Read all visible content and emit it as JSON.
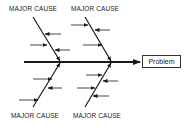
{
  "diagram": {
    "type": "fishbone",
    "problem_label": "Problem",
    "causes": [
      {
        "position": "top-left",
        "label": "MAJOR CAUSE",
        "minor_arrows": 3
      },
      {
        "position": "top-right",
        "label": "MAJOR CAUSE",
        "minor_arrows": 3
      },
      {
        "position": "bottom-left",
        "label": "MAJOR CAUSE",
        "minor_arrows": 3
      },
      {
        "position": "bottom-right",
        "label": "MAJOR CAUSE",
        "minor_arrows": 4
      }
    ],
    "colors": {
      "line": "#1a1a1a",
      "background": "#ffffff"
    }
  }
}
